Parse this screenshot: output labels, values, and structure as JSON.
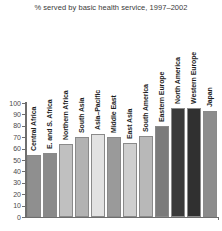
{
  "chart_data": {
    "type": "bar",
    "title": "% served by basic health service, 1997–2002",
    "xlabel": "",
    "ylabel": "",
    "ylim": [
      0,
      100
    ],
    "yticks": [
      0,
      10,
      20,
      30,
      40,
      50,
      60,
      70,
      80,
      90,
      100
    ],
    "grid": false,
    "legend": "none",
    "categories": [
      "Central Africa",
      "E. and S. Africa",
      "Northern Africa",
      "South Asia",
      "Asia–Pacific",
      "Middle East",
      "East Asia",
      "South America",
      "Eastern Europe",
      "North America",
      "Western Europe",
      "Japan"
    ],
    "values": [
      54,
      56,
      64,
      70,
      73,
      70,
      65,
      71,
      80,
      96,
      96,
      93
    ],
    "bar_colors": [
      "#8f8f8f",
      "#8a8a8a",
      "#c0c0c0",
      "#b2b2b2",
      "#e2e2e2",
      "#9a9a9a",
      "#cfcfcf",
      "#b8b8b8",
      "#7b7b7b",
      "#3a3a3a",
      "#303030",
      "#8c8c8c"
    ]
  },
  "axis": {
    "y_tick_labels": [
      "100",
      "90",
      "80",
      "70",
      "60",
      "50",
      "40",
      "30",
      "20",
      "10",
      "0"
    ]
  }
}
